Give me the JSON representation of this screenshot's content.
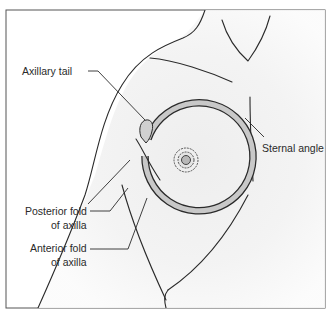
{
  "figure": {
    "type": "anatomical-line-drawing",
    "labels": {
      "axillary_tail": "Axillary tail",
      "sternal_angle": "Sternal angle",
      "posterior_fold_line1": "Posterior fold",
      "posterior_fold_line2": "of axilla",
      "anterior_fold_line1": "Anterior fold",
      "anterior_fold_line2": "of axilla"
    },
    "colors": {
      "frame": "#555555",
      "line": "#2a2a2a",
      "shading": "#e6e6e6",
      "breast_ring_fill": "#c8c8c8",
      "tail_fill": "#d0d0d0",
      "background": "#ffffff"
    }
  }
}
